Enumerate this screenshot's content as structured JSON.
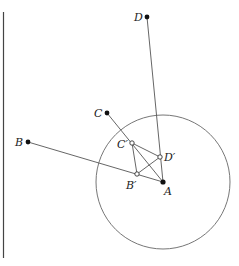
{
  "diagram": {
    "points": {
      "A": {
        "label": "A",
        "x": 163,
        "y": 182
      },
      "B": {
        "label": "B",
        "x": 28,
        "y": 142
      },
      "C": {
        "label": "C",
        "x": 107,
        "y": 113
      },
      "D": {
        "label": "D",
        "x": 147,
        "y": 17
      },
      "A'": {
        "label": "",
        "x": 163,
        "y": 182
      },
      "B'": {
        "label": "B′",
        "x": 137,
        "y": 174
      },
      "C'": {
        "label": "C′",
        "x": 132,
        "y": 143
      },
      "D'": {
        "label": "D′",
        "x": 160,
        "y": 157
      }
    },
    "circle": {
      "cx": 163,
      "cy": 182,
      "r": 67
    },
    "labels": {
      "A": "A",
      "B": "B",
      "C": "C",
      "D": "D",
      "Bp": "B′",
      "Cp": "C′",
      "Dp": "D′"
    },
    "line_color": "#555555",
    "point_color": "#111111"
  }
}
